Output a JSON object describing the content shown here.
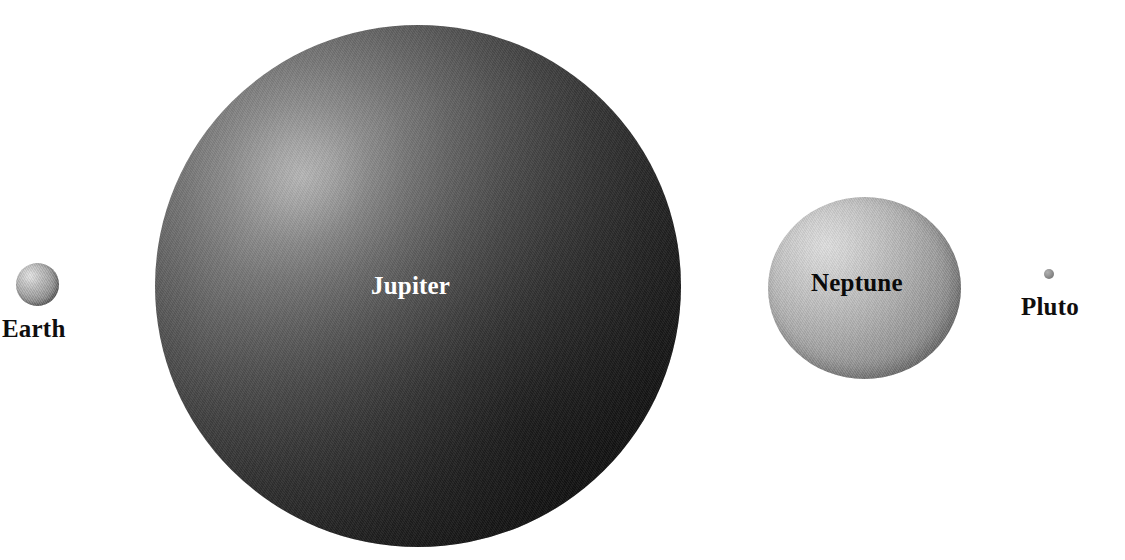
{
  "figure": {
    "background_color": "#ffffff",
    "width": 1125,
    "height": 560
  },
  "chart_data": {
    "type": "scatter",
    "title": "",
    "xlabel": "",
    "ylabel": "",
    "categories": [
      "Earth",
      "Jupiter",
      "Neptune",
      "Pluto"
    ],
    "values": [
      43,
      526,
      193,
      10
    ],
    "value_units": "rendered pixel diameter",
    "grid": false,
    "legend": "none",
    "points": [
      {
        "name": "Earth",
        "label": "Earth",
        "center_x": 37,
        "center_y": 284,
        "diameter": 43,
        "fill_color": "#a2a2a2",
        "highlight_color": "#e3e3e3",
        "shadow_color": "#4a4a4a",
        "label_color": "#100e0e",
        "label_position": "below"
      },
      {
        "name": "Jupiter",
        "label": "Jupiter",
        "center_x": 418,
        "center_y": 286,
        "diameter": 526,
        "fill_color": "#3a3a3a",
        "highlight_color": "#b6b6b6",
        "shadow_color": "#0a0a0a",
        "label_color": "#ffffff",
        "label_position": "inside"
      },
      {
        "name": "Neptune",
        "label": "Neptune",
        "center_x": 864,
        "center_y": 288,
        "diameter": 193,
        "fill_color": "#ababab",
        "highlight_color": "#dcdcdc",
        "shadow_color": "#525252",
        "label_color": "#0b0b0b",
        "label_position": "inside"
      },
      {
        "name": "Pluto",
        "label": "Pluto",
        "center_x": 1049,
        "center_y": 274,
        "diameter": 10,
        "fill_color": "#9a9a9a",
        "highlight_color": "#b0b0b0",
        "shadow_color": "#6b6b6b",
        "label_color": "#100e0e",
        "label_position": "below"
      }
    ]
  },
  "labels": {
    "earth": "Earth",
    "jupiter": "Jupiter",
    "neptune": "Neptune",
    "pluto": "Pluto"
  }
}
